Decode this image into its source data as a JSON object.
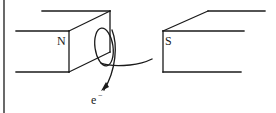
{
  "diagram": {
    "type": "physics-illustration",
    "magnets": [
      {
        "pole_label": "N",
        "side": "left"
      },
      {
        "pole_label": "S",
        "side": "right"
      }
    ],
    "particle_label": "e",
    "particle_charge_superscript": "−",
    "colors": {
      "line": "#1a1a1a",
      "background": "#ffffff"
    }
  }
}
